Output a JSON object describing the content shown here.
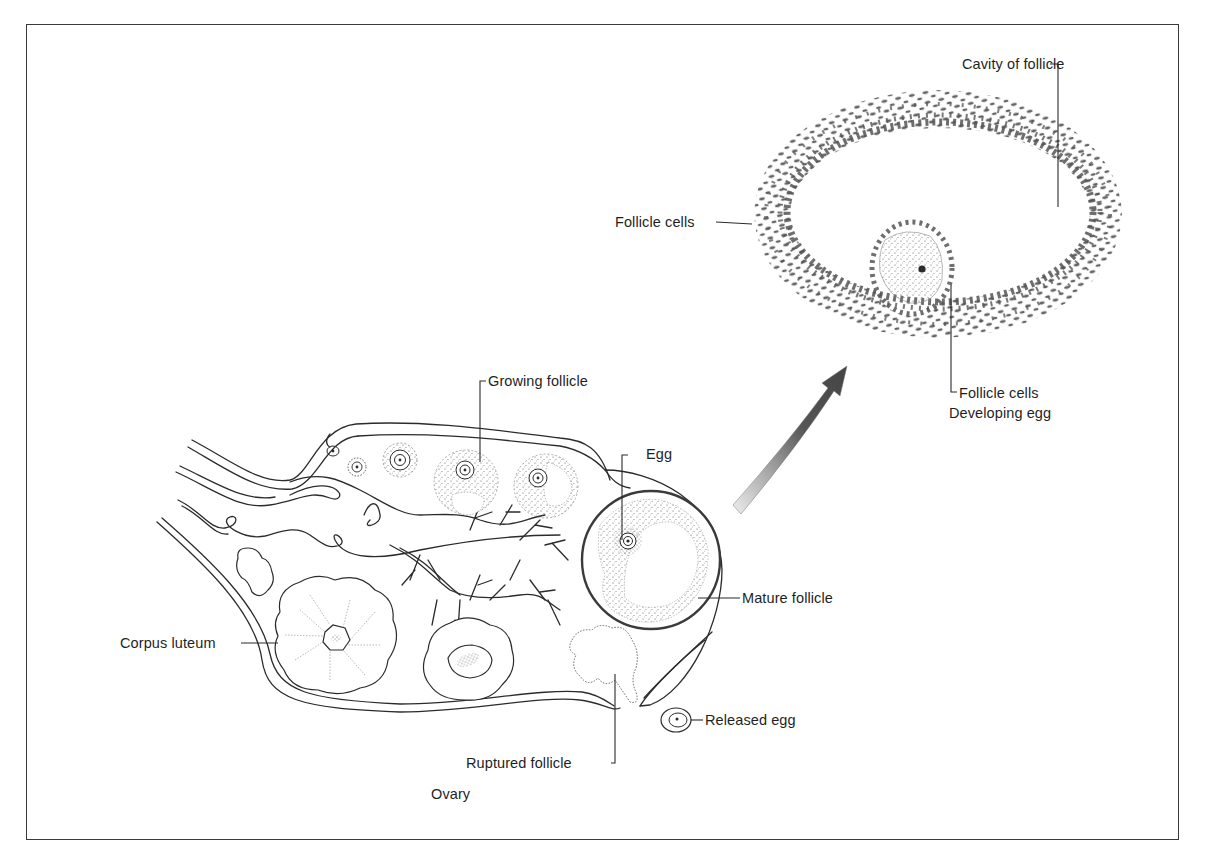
{
  "figure": {
    "colors": {
      "ink": "#2b2b2b",
      "cell": "#555555",
      "background": "#ffffff",
      "frame": "#3a3a3a"
    }
  },
  "labels": {
    "cavity_of_follicle": "Cavity of follicle",
    "follicle_cells_outer": "Follicle cells",
    "follicle_cells_inner": "Follicle cells",
    "developing_egg": "Developing egg",
    "growing_follicle": "Growing follicle",
    "egg": "Egg",
    "mature_follicle": "Mature follicle",
    "corpus_luteum": "Corpus luteum",
    "released_egg": "Released egg",
    "ruptured_follicle": "Ruptured follicle",
    "ovary": "Ovary"
  },
  "icons": {
    "arrow": "curved-arrow-icon"
  }
}
